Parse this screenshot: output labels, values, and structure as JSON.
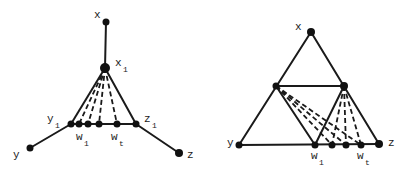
{
  "figures": [
    {
      "id": "left",
      "labels": {
        "x": "x",
        "x1_main": "x",
        "x1_sub": "1",
        "y1_main": "y",
        "y1_sub": "1",
        "z1_main": "z",
        "z1_sub": "1",
        "w1_main": "w",
        "w1_sub": "1",
        "wt_main": "w",
        "wt_sub": "t",
        "y": "y",
        "z": "z"
      }
    },
    {
      "id": "right",
      "labels": {
        "x": "x",
        "y": "y",
        "z": "z",
        "w1_main": "w",
        "w1_sub": "1",
        "wt_main": "w",
        "wt_sub": "t"
      }
    }
  ],
  "colors": {
    "ink": "#1a1a1a",
    "background": "#ffffff"
  }
}
